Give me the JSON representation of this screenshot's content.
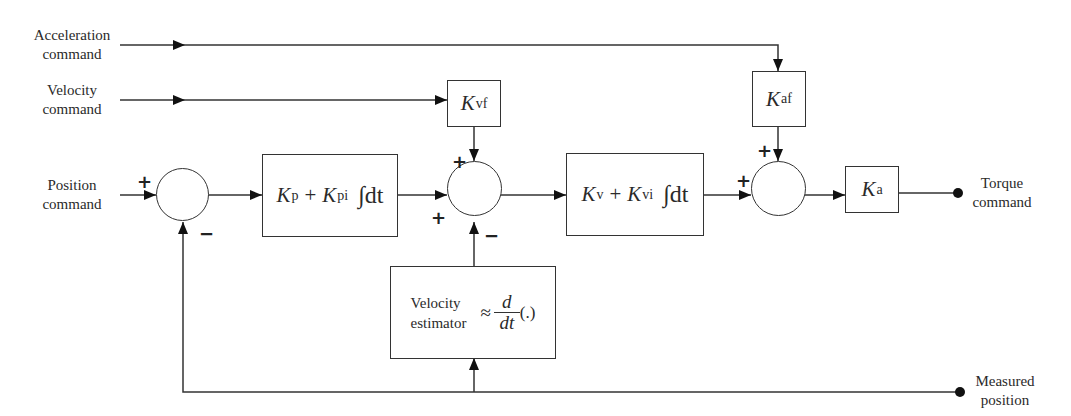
{
  "diagram": {
    "inputs": {
      "acceleration_command": [
        "Acceleration",
        "command"
      ],
      "velocity_command": [
        "Velocity",
        "command"
      ],
      "position_command": [
        "Position",
        "command"
      ]
    },
    "outputs": {
      "torque_command": [
        "Torque",
        "command"
      ],
      "measured_position": [
        "Measured",
        "position"
      ]
    },
    "blocks": {
      "kvf": {
        "symbol": "K",
        "sub": "vf"
      },
      "kaf": {
        "symbol": "K",
        "sub": "af"
      },
      "ka": {
        "symbol": "K",
        "sub": "a"
      },
      "position_pi": {
        "k1": "K",
        "k1_sub": "p",
        "op": "+",
        "k2": "K",
        "k2_sub": "pi",
        "integral": "∫dt"
      },
      "velocity_pi": {
        "k1": "K",
        "k1_sub": "v",
        "op": "+",
        "k2": "K",
        "k2_sub": "vi",
        "integral": "∫dt"
      },
      "velocity_estimator": {
        "label_line1": "Velocity",
        "label_line2": "estimator",
        "approx": "≈",
        "num": "d",
        "den": "dt",
        "arg": "(.)"
      }
    },
    "summing_junctions": {
      "sum1": {
        "signs": [
          "+",
          "−"
        ]
      },
      "sum2": {
        "signs": [
          "+",
          "+",
          "−"
        ]
      },
      "sum3": {
        "signs": [
          "+",
          "+"
        ]
      }
    },
    "signs": {
      "plus": "+",
      "minus": "−"
    },
    "colors": {
      "line": "#333333",
      "background": "#ffffff"
    }
  }
}
